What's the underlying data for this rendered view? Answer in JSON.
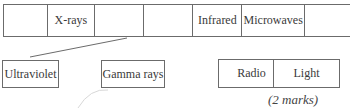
{
  "spectrum_table": {
    "cells": [
      {
        "label": "",
        "width": 44
      },
      {
        "label": "X-rays",
        "width": 47
      },
      {
        "label": "",
        "width": 49
      },
      {
        "label": "",
        "width": 50
      },
      {
        "label": "Infrared",
        "width": 49
      },
      {
        "label": "Microwaves",
        "width": 63
      },
      {
        "label": "",
        "width": 45
      }
    ]
  },
  "answer_options": [
    {
      "label": "Ultraviolet"
    },
    {
      "label": "Gamma rays"
    },
    {
      "label": "Radio"
    },
    {
      "label": "Light"
    }
  ],
  "marks_label": "(2 marks)",
  "colors": {
    "line": "#6b6b6b",
    "text": "#3a3a3a"
  }
}
